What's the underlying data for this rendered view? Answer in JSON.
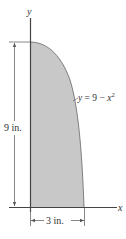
{
  "figure": {
    "axes": {
      "x_label": "x",
      "y_label": "y"
    },
    "curve": {
      "equation_lhs": "y",
      "equation_rhs_const": "= 9 −",
      "equation_var": "x",
      "equation_exp": "2"
    },
    "dimensions": {
      "height_label": "9 in.",
      "width_label": "3 in."
    },
    "colors": {
      "fill": "#c8c8c8",
      "line": "#444444",
      "background": "#ffffff"
    }
  }
}
